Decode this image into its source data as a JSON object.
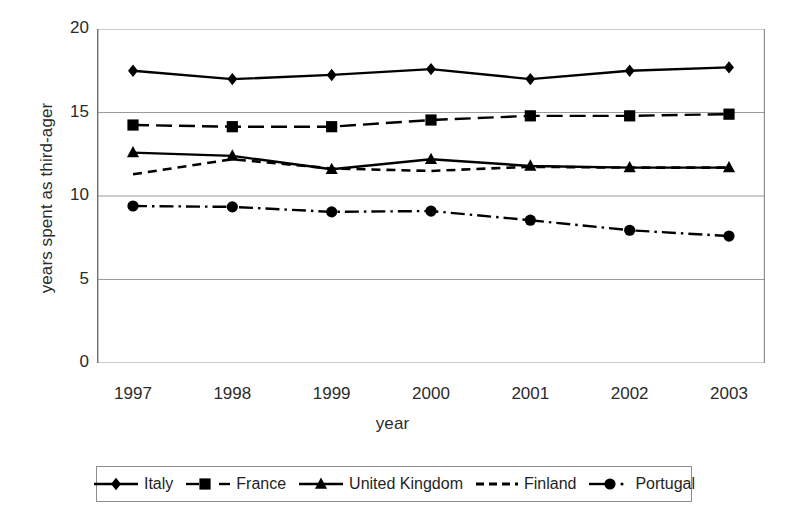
{
  "chart_data": {
    "type": "line",
    "title": "",
    "xlabel": "year",
    "ylabel": "years spent as third-ager",
    "categories": [
      "1997",
      "1998",
      "1999",
      "2000",
      "2001",
      "2002",
      "2003"
    ],
    "x": [
      1997,
      1998,
      1999,
      2000,
      2001,
      2002,
      2003
    ],
    "ylim": [
      0,
      20
    ],
    "yticks": [
      0,
      5,
      10,
      15,
      20
    ],
    "grid": "horizontal",
    "legend_position": "bottom",
    "series": [
      {
        "name": "Italy",
        "marker": "diamond",
        "line_style": "solid",
        "color": "#000000",
        "values": [
          17.5,
          17.0,
          17.25,
          17.6,
          17.0,
          17.5,
          17.7
        ]
      },
      {
        "name": "France",
        "marker": "square",
        "line_style": "dashed",
        "color": "#000000",
        "values": [
          14.25,
          14.15,
          14.15,
          14.55,
          14.8,
          14.8,
          14.9
        ]
      },
      {
        "name": "United Kingdom",
        "marker": "triangle",
        "line_style": "solid",
        "color": "#000000",
        "values": [
          12.6,
          12.4,
          11.6,
          12.2,
          11.8,
          11.7,
          11.7
        ]
      },
      {
        "name": "Finland",
        "marker": "none",
        "line_style": "dashed-fine",
        "color": "#000000",
        "values": [
          11.3,
          12.2,
          11.65,
          11.5,
          11.75,
          11.7,
          11.7
        ]
      },
      {
        "name": "Portugal",
        "marker": "circle",
        "line_style": "dash-dot",
        "color": "#000000",
        "values": [
          9.4,
          9.35,
          9.05,
          9.1,
          8.55,
          7.95,
          7.6
        ]
      }
    ]
  },
  "legend": {
    "items": [
      {
        "label": "Italy",
        "key": "diamond-solid"
      },
      {
        "label": "France",
        "key": "square-dashed"
      },
      {
        "label": "United Kingdom",
        "key": "triangle-solid"
      },
      {
        "label": "Finland",
        "key": "line-dashed"
      },
      {
        "label": "Portugal",
        "key": "circle-dashdot"
      }
    ]
  }
}
